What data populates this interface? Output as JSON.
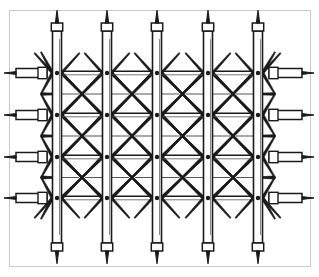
{
  "figure": {
    "name": "truss-lattice-structure",
    "caption": "",
    "background_color": "#ffffff",
    "frame": {
      "border_color": "#c8c8c8",
      "border_width": 1,
      "inset_left": 9,
      "inset_top": 10,
      "inset_right": 310,
      "inset_bottom": 266,
      "fill": "#ffffff"
    },
    "ink_color": "#1a1a1a",
    "hairline_color": "#555555"
  },
  "geometry": {
    "vertical_posts": {
      "count": 5,
      "x_centers": [
        57,
        107,
        157,
        208,
        258
      ],
      "half_width": 4.5,
      "top_y": 31,
      "bottom_y": 243,
      "cap_height": 8,
      "tip_length": 13,
      "stroke_width": 1.6
    },
    "node_rows": {
      "count": 4,
      "y_centers": [
        73,
        115,
        157,
        198
      ],
      "dot_radius": 2.2
    },
    "side_stubs": {
      "left_x_outer": 16,
      "left_x_inner": 47,
      "right_x_outer": 302,
      "right_x_inner": 269,
      "cap_width": 9,
      "half_height": 4.5,
      "tip_length": 12
    },
    "bay_midpoints_x": [
      82,
      132,
      182.5,
      233
    ],
    "brace_mid_y": [
      94,
      136,
      177.5
    ],
    "outer_fan_half": 21
  },
  "chart_data": {
    "type": "diagram",
    "title": "",
    "elements": {
      "vertical_chords": 5,
      "horizontal_node_levels": 4,
      "node_joints_per_chord": 4,
      "total_node_joints": 20,
      "diagonal_brace_bays": 4,
      "left_side_stubs": 4,
      "right_side_stubs": 4,
      "pointed_tips_top": 5,
      "pointed_tips_bottom": 5
    }
  }
}
